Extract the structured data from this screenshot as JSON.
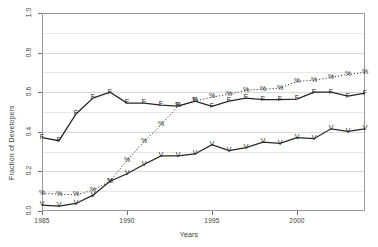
{
  "chart_data": {
    "type": "line",
    "title": "",
    "xlabel": "Years",
    "ylabel": "Fraction of Developers",
    "xlim": [
      1985,
      2004
    ],
    "ylim": [
      0.0,
      1.0
    ],
    "grid": true,
    "legend_position": "none",
    "x": [
      1985,
      1986,
      1987,
      1988,
      1989,
      1990,
      1991,
      1992,
      1993,
      1994,
      1995,
      1996,
      1997,
      1998,
      1999,
      2000,
      2001,
      2002,
      2003,
      2004
    ],
    "xticks": [
      1985,
      1990,
      1995,
      2000
    ],
    "xtick_labels": [
      "1985",
      "1990",
      "1995",
      "2000"
    ],
    "yticks": [
      0.0,
      0.2,
      0.4,
      0.6,
      0.8,
      1.0
    ],
    "ytick_labels": [
      "0.0",
      "0.2",
      "0.4",
      "0.6",
      "0.8",
      "1.0"
    ],
    "series": [
      {
        "name": "F",
        "marker": "F",
        "linestyle": "solid",
        "color": "#262626",
        "values": [
          0.37,
          0.355,
          0.49,
          0.57,
          0.6,
          0.545,
          0.545,
          0.535,
          0.53,
          0.555,
          0.528,
          0.555,
          0.57,
          0.562,
          0.562,
          0.565,
          0.6,
          0.6,
          0.58,
          0.595
        ]
      },
      {
        "name": "%",
        "marker": "%",
        "linestyle": "dotted",
        "color": "#262626",
        "values": [
          0.09,
          0.085,
          0.082,
          0.105,
          0.15,
          0.255,
          0.35,
          0.435,
          0.53,
          0.555,
          0.575,
          0.59,
          0.61,
          0.615,
          0.62,
          0.655,
          0.66,
          0.675,
          0.69,
          0.7
        ]
      },
      {
        "name": "V",
        "marker": "V",
        "linestyle": "solid",
        "color": "#262626",
        "values": [
          0.03,
          0.025,
          0.038,
          0.08,
          0.15,
          0.188,
          0.235,
          0.278,
          0.278,
          0.288,
          0.335,
          0.305,
          0.32,
          0.348,
          0.342,
          0.37,
          0.365,
          0.415,
          0.402,
          0.415
        ]
      }
    ]
  }
}
